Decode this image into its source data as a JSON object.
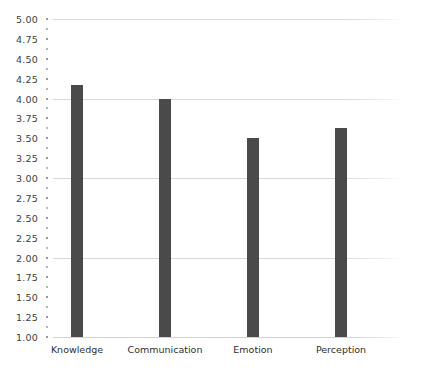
{
  "chart_data": {
    "type": "bar",
    "title": "",
    "subtitle": "",
    "xlabel": "",
    "ylabel": "",
    "categories": [
      "Knowledge",
      "Communication",
      "Emotion",
      "Perception"
    ],
    "values": [
      4.17,
      4.0,
      3.5,
      3.63
    ],
    "series": [
      {
        "name": "",
        "values": [
          4.17,
          4.0,
          3.5,
          3.63
        ]
      }
    ],
    "ylim": [
      1.0,
      5.0
    ],
    "ytick_step": 0.25,
    "ytick_labels": [
      "5.00",
      "4.75",
      "4.50",
      "4.25",
      "4.00",
      "3.75",
      "3.50",
      "3.25",
      "3.00",
      "2.75",
      "2.50",
      "2.25",
      "2.00",
      "1.75",
      "1.50",
      "1.25",
      "1.00"
    ],
    "ytick_values": [
      5.0,
      4.75,
      4.5,
      4.25,
      4.0,
      3.75,
      3.5,
      3.25,
      3.0,
      2.75,
      2.5,
      2.25,
      2.0,
      1.75,
      1.5,
      1.25,
      1.0
    ],
    "gridline_values": [
      5.0,
      4.0,
      3.0,
      2.0,
      1.0
    ],
    "grid": true,
    "legend": false,
    "legend_position": "none",
    "bar_color": "#4a4a4a",
    "background_color": "#ffffff",
    "gridline_color": "#d9d9d9",
    "annotations": []
  }
}
